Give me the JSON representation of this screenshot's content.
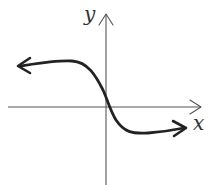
{
  "figure": {
    "axes": {
      "x_label": "x",
      "y_label": "y"
    },
    "colors": {
      "background": "#ffffff",
      "axis": "#555555",
      "curve": "#222222",
      "label": "#333333"
    },
    "curve": {
      "shape": "decreasing S-curve",
      "left_end_behavior": "approaches a positive horizontal level (arrow pointing left)",
      "right_end_behavior": "approaches a negative horizontal level (arrow pointing right)",
      "crosses_y_axis": "positive y, just above origin",
      "crosses_x_axis": "just right of origin"
    }
  }
}
